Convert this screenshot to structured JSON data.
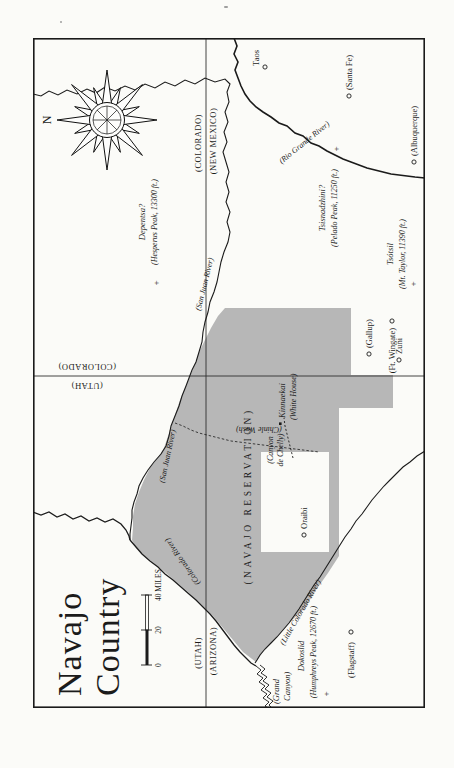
{
  "page": {
    "bg": "#fbfbf8"
  },
  "map": {
    "title": {
      "line1": "Navajo",
      "line2": "Country"
    },
    "compass": {
      "north_label": "N"
    },
    "scale_bar": {
      "tick0": "0",
      "tick20": "20",
      "tick40": "40 MILES"
    },
    "state_labels": {
      "co_nm": {
        "north": "(COLORADO)",
        "south": "(NEW MEXICO)"
      },
      "ut_az": {
        "north": "(UTAH)",
        "south": "(ARIZONA)"
      },
      "ut_co": {
        "west": "(UTAH)",
        "east": "(COLORADO)"
      }
    },
    "reservation_label": "(NAVAJO RESERVATION)",
    "rivers": {
      "rio_grande": "(Rio Grande River)",
      "san_juan_nm": "(San Juan River)",
      "san_juan_ut": "(San Juan River)",
      "colorado": "(Colorado River)",
      "little_colorado": "(Little Colorado River)",
      "chinle_wash": "(Chinle Wash)"
    },
    "grand_canyon": {
      "line1": "(Grand",
      "line2": "Canyon)"
    },
    "towns": {
      "taos": "Taos",
      "santa_fe": "(Santa Fe)",
      "albuquerque": "(Albuquerque)",
      "gallup": "(Gallup)",
      "ft_wingate": "(Ft. Wingate)",
      "zuni": "Zuni",
      "oraibi": "Oraibi",
      "flagstaff": "(Flagstaff)"
    },
    "peaks": {
      "hesperus": {
        "name": "Depentsa?",
        "detail": "(Hesperus Peak, 13300 ft.)",
        "marker": "+"
      },
      "pelado": {
        "name": "Tsisnadzhini?",
        "detail": "(Pelado Peak, 11250 ft.)",
        "marker": "+"
      },
      "mt_taylor": {
        "name": "Tsótsil",
        "detail": "(Mt. Taylor, 11390 ft.)",
        "marker": "+"
      },
      "humphreys": {
        "name": "Dokoslid",
        "detail": "(Humphreys Peak, 12670 ft.)",
        "marker": "+"
      }
    },
    "places": {
      "white_house": {
        "name": "Kinnaekai",
        "detail": "(White House)"
      },
      "canyon_de_chelly": {
        "line1": "(Canyon",
        "line2": "de Chelly)"
      }
    },
    "colors": {
      "reservation_fill": "#b7b7b7",
      "ink": "#1b1b1b"
    }
  }
}
